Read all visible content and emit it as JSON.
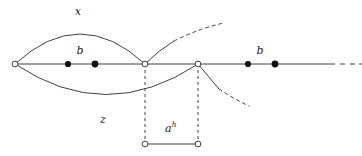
{
  "figure": {
    "canvas": {
      "width": 362,
      "height": 156,
      "background": "#ffffff"
    },
    "stroke_color": "#2b2b2b",
    "labels": [
      {
        "id": "x",
        "text": "x",
        "sup": "",
        "x": 78,
        "y": 11
      },
      {
        "id": "b1",
        "text": "b",
        "sup": "",
        "x": 80,
        "y": 50
      },
      {
        "id": "b2",
        "text": "b",
        "sup": "",
        "x": 260,
        "y": 50
      },
      {
        "id": "z",
        "text": "z",
        "sup": "",
        "x": 103,
        "y": 119
      },
      {
        "id": "ah",
        "text": "a",
        "sup": "h",
        "x": 171,
        "y": 128
      }
    ],
    "open_nodes": [
      {
        "id": "v0",
        "x": 15,
        "y": 64
      },
      {
        "id": "v1",
        "x": 145,
        "y": 64
      },
      {
        "id": "v2",
        "x": 198,
        "y": 64
      },
      {
        "id": "v3",
        "x": 145,
        "y": 144
      },
      {
        "id": "v4",
        "x": 198,
        "y": 144
      }
    ],
    "filled_nodes": [
      {
        "id": "p1",
        "x": 68,
        "y": 64
      },
      {
        "id": "p2",
        "x": 95,
        "y": 64
      },
      {
        "id": "p3",
        "x": 248,
        "y": 64
      },
      {
        "id": "p4",
        "x": 275,
        "y": 64
      }
    ],
    "baseline": {
      "x1": 15,
      "y1": 64,
      "x2": 335,
      "y2": 64
    },
    "ellipsis_dashes": [
      {
        "x1": 340,
        "y1": 64,
        "x2": 345,
        "y2": 64
      },
      {
        "x1": 350,
        "y1": 64,
        "x2": 355,
        "y2": 64
      },
      {
        "x1": 359,
        "y1": 64,
        "x2": 362,
        "y2": 64
      }
    ],
    "arc_top": "M 15 64 Q 80 4 145 64",
    "arc_bottom": "M 15 64 Q 106 125 198 64",
    "branch_upper_solid": "M 145 64 Q 159 50 174 41",
    "branch_upper_dashed": "M 174 41 Q 200 28 224 23",
    "branch_lower_solid": "M 198 64 Q 208 76 219 89",
    "branch_lower_dashed": "M 219 89 Q 234 99 249 106",
    "drop_left": {
      "x1": 145,
      "y1": 64,
      "x2": 145,
      "y2": 144
    },
    "drop_right": {
      "x1": 198,
      "y1": 64,
      "x2": 198,
      "y2": 144
    },
    "bottom_segment": {
      "x1": 145,
      "y1": 144,
      "x2": 198,
      "y2": 144
    }
  }
}
